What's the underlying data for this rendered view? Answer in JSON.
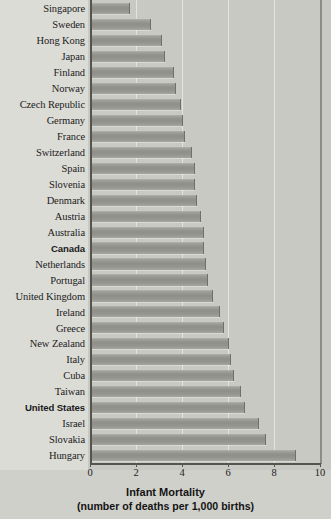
{
  "chart_data": {
    "type": "bar",
    "orientation": "horizontal",
    "title": "",
    "xlabel": "Infant Mortality",
    "xlabel_sub": "(number of deaths per 1,000 births)",
    "ylabel": "",
    "xlim": [
      0,
      10
    ],
    "xticks": [
      0,
      2,
      4,
      6,
      8,
      10
    ],
    "xticklabels": [
      "0",
      "2",
      "4",
      "6",
      "8",
      "10"
    ],
    "grid": true,
    "grid_axis": "x",
    "legend": false,
    "bar_color": "#9a9a95",
    "categories": [
      "Singapore",
      "Sweden",
      "Hong Kong",
      "Japan",
      "Finland",
      "Norway",
      "Czech Republic",
      "Germany",
      "France",
      "Switzerland",
      "Spain",
      "Slovenia",
      "Denmark",
      "Austria",
      "Australia",
      "Canada",
      "Netherlands",
      "Portugal",
      "United Kingdom",
      "Ireland",
      "Greece",
      "New Zealand",
      "Italy",
      "Cuba",
      "Taiwan",
      "United States",
      "Israel",
      "Slovakia",
      "Hungary"
    ],
    "values": [
      1.7,
      2.6,
      3.1,
      3.2,
      3.6,
      3.7,
      3.9,
      4.0,
      4.1,
      4.4,
      4.5,
      4.5,
      4.6,
      4.8,
      4.9,
      4.9,
      5.0,
      5.1,
      5.3,
      5.6,
      5.8,
      6.0,
      6.1,
      6.2,
      6.5,
      6.7,
      7.3,
      7.6,
      8.9
    ],
    "highlighted": [
      "Canada",
      "United States"
    ]
  }
}
